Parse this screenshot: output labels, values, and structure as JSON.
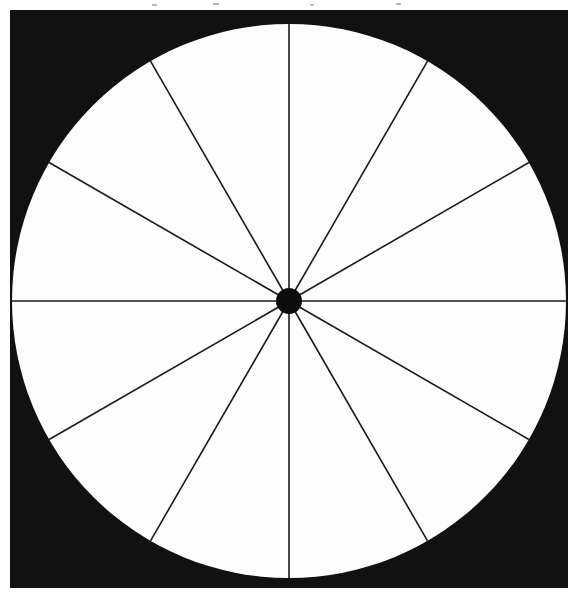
{
  "figure": {
    "name": "twelve-sector-circle-wheel",
    "page_background_color": "#ffffff",
    "frame": {
      "shape": "square",
      "fill_color": "#111111",
      "x": 10,
      "y": 10,
      "width": 558,
      "height": 578
    },
    "circle": {
      "fill_color": "#fdfdfd",
      "center_x": 289,
      "center_y": 301,
      "radius": 277,
      "inscribed_in_frame": "true"
    },
    "hub": {
      "fill_color": "#0d0d0d",
      "center_x": 289,
      "center_y": 301,
      "radius": 13
    },
    "spokes": {
      "count": 12,
      "stroke_color": "#1a1a1a",
      "stroke_width": 1.6,
      "angle_step_degrees": 30,
      "sector_count": 12,
      "sector_angle_degrees": 30,
      "items": [
        {
          "label": "spoke-000",
          "angle_degrees": 0
        },
        {
          "label": "spoke-030",
          "angle_degrees": 30
        },
        {
          "label": "spoke-060",
          "angle_degrees": 60
        },
        {
          "label": "spoke-090",
          "angle_degrees": 90
        },
        {
          "label": "spoke-120",
          "angle_degrees": 120
        },
        {
          "label": "spoke-150",
          "angle_degrees": 150
        },
        {
          "label": "spoke-180",
          "angle_degrees": 180
        },
        {
          "label": "spoke-210",
          "angle_degrees": 210
        },
        {
          "label": "spoke-240",
          "angle_degrees": 240
        },
        {
          "label": "spoke-270",
          "angle_degrees": 270
        },
        {
          "label": "spoke-300",
          "angle_degrees": 300
        },
        {
          "label": "spoke-330",
          "angle_degrees": 330
        }
      ]
    },
    "scan_artifacts": {
      "present": "true",
      "specks": [
        {
          "x": 152,
          "y": 4,
          "w": 5,
          "h": 2
        },
        {
          "x": 213,
          "y": 3,
          "w": 6,
          "h": 2
        },
        {
          "x": 310,
          "y": 4,
          "w": 4,
          "h": 2
        },
        {
          "x": 396,
          "y": 3,
          "w": 5,
          "h": 2
        }
      ]
    }
  }
}
